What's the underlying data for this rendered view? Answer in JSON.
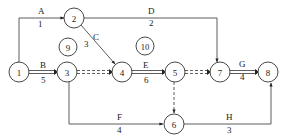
{
  "diagram": {
    "type": "activity-on-arrow network",
    "nodes": [
      {
        "id": "1",
        "label": "1",
        "x": 19,
        "y": 72
      },
      {
        "id": "2",
        "label": "2",
        "x": 74,
        "y": 18
      },
      {
        "id": "3",
        "label": "3",
        "x": 67,
        "y": 72
      },
      {
        "id": "4",
        "label": "4",
        "x": 122,
        "y": 72
      },
      {
        "id": "5",
        "label": "5",
        "x": 175,
        "y": 72
      },
      {
        "id": "6",
        "label": "6",
        "x": 174,
        "y": 124
      },
      {
        "id": "7",
        "label": "7",
        "x": 220,
        "y": 72
      },
      {
        "id": "8",
        "label": "8",
        "x": 268,
        "y": 72
      },
      {
        "id": "9",
        "label": "9",
        "x": 68,
        "y": 47
      },
      {
        "id": "10",
        "label": "10",
        "x": 145,
        "y": 46
      }
    ],
    "activities": [
      {
        "name": "A",
        "duration": "1",
        "from": "1",
        "to": "2",
        "critical": false,
        "dummy": false
      },
      {
        "name": "B",
        "duration": "5",
        "from": "1",
        "to": "3",
        "critical": true,
        "dummy": false
      },
      {
        "name": "C",
        "duration": "3",
        "from": "2",
        "to": "4",
        "critical": false,
        "dummy": false
      },
      {
        "name": "D",
        "duration": "2",
        "from": "2",
        "to": "7",
        "critical": false,
        "dummy": false
      },
      {
        "name": "",
        "duration": "",
        "from": "3",
        "to": "4",
        "critical": true,
        "dummy": true
      },
      {
        "name": "E",
        "duration": "6",
        "from": "4",
        "to": "5",
        "critical": true,
        "dummy": false
      },
      {
        "name": "",
        "duration": "",
        "from": "5",
        "to": "7",
        "critical": true,
        "dummy": true
      },
      {
        "name": "",
        "duration": "",
        "from": "5",
        "to": "6",
        "critical": false,
        "dummy": true
      },
      {
        "name": "F",
        "duration": "4",
        "from": "3",
        "to": "6",
        "critical": false,
        "dummy": false
      },
      {
        "name": "G",
        "duration": "4",
        "from": "7",
        "to": "8",
        "critical": true,
        "dummy": false
      },
      {
        "name": "H",
        "duration": "3",
        "from": "6",
        "to": "8",
        "critical": false,
        "dummy": false
      }
    ],
    "colors": {
      "line": "#333333",
      "node_fill": "#ffffff",
      "background": "#ffffff"
    }
  }
}
